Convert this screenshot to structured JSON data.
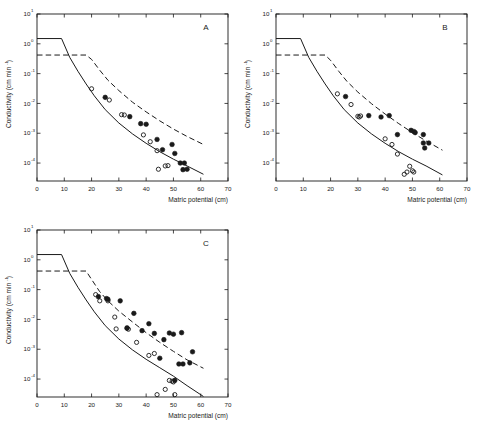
{
  "figure": {
    "panel_count": 3,
    "background": "#ffffff",
    "ink": "#1a1a1a"
  },
  "axes": {
    "x_title": "Matric potential (cm)",
    "y_title_main": "Conductivity (cm min",
    "y_title_exponent": "-1",
    "y_title_close": ")",
    "x_ticks": [
      "0",
      "10",
      "20",
      "30",
      "40",
      "50",
      "60",
      "70"
    ],
    "x_tick_values": [
      0,
      10,
      20,
      30,
      40,
      50,
      60,
      70
    ],
    "x_range": [
      0,
      70
    ],
    "y_tick_mantissa": "10",
    "y_tick_exponents": [
      "1",
      "0",
      "-1",
      "-2",
      "-3",
      "-4"
    ],
    "y_tick_values": [
      10,
      1,
      0.1,
      0.01,
      0.001,
      0.0001
    ],
    "y_range_log": [
      1,
      -4.6
    ],
    "grid": "off",
    "tick_direction": "inward"
  },
  "chart_data": {
    "type": "scatter",
    "title": "",
    "xlabel": "Matric potential (cm)",
    "ylabel": "Conductivity (cm min^-1)",
    "xlim": [
      0,
      70
    ],
    "ylim": [
      2.5e-05,
      10
    ],
    "yscale": "log",
    "grid": false,
    "legend": "none",
    "series_styles": {
      "filled_circle": "measured, closed symbol",
      "open_circle": "measured, open symbol",
      "solid_line": "model curve (solid)",
      "dashed_line": "model curve (dashed)"
    },
    "panels": [
      {
        "label": "A",
        "solid_curve": [
          [
            0,
            1.5
          ],
          [
            9,
            1.5
          ],
          [
            12,
            0.35
          ],
          [
            15,
            0.12
          ],
          [
            18,
            0.045
          ],
          [
            21,
            0.018
          ],
          [
            25,
            0.0062
          ],
          [
            30,
            0.0022
          ],
          [
            35,
            0.00095
          ],
          [
            40,
            0.00046
          ],
          [
            45,
            0.00024
          ],
          [
            50,
            0.000135
          ],
          [
            55,
            8e-05
          ],
          [
            61,
            4.2e-05
          ]
        ],
        "dashed_curve": [
          [
            0,
            0.42
          ],
          [
            18,
            0.42
          ],
          [
            20,
            0.3
          ],
          [
            23,
            0.13
          ],
          [
            26,
            0.06
          ],
          [
            30,
            0.027
          ],
          [
            35,
            0.011
          ],
          [
            40,
            0.0052
          ],
          [
            45,
            0.0026
          ],
          [
            50,
            0.00138
          ],
          [
            55,
            0.00078
          ],
          [
            61,
            0.00042
          ]
        ],
        "filled_points": [
          [
            25,
            0.016
          ],
          [
            34,
            0.0036
          ],
          [
            38,
            0.0021
          ],
          [
            40,
            0.002
          ],
          [
            44,
            0.00062
          ],
          [
            46,
            0.00028
          ],
          [
            49.5,
            0.00042
          ],
          [
            50.5,
            0.00021
          ],
          [
            52.5,
            0.0001
          ],
          [
            54,
            0.0001
          ],
          [
            53.5,
            6e-05
          ],
          [
            55,
            6.2e-05
          ]
        ],
        "open_points": [
          [
            20,
            0.031
          ],
          [
            26.5,
            0.013
          ],
          [
            31,
            0.0042
          ],
          [
            32,
            0.0041
          ],
          [
            39,
            0.00088
          ],
          [
            41.5,
            0.00052
          ],
          [
            44,
            0.00026
          ],
          [
            44.5,
            6.2e-05
          ],
          [
            47,
            8e-05
          ],
          [
            48,
            8.2e-05
          ]
        ]
      },
      {
        "label": "B",
        "solid_curve": [
          [
            0,
            1.5
          ],
          [
            9,
            1.5
          ],
          [
            12,
            0.35
          ],
          [
            15,
            0.12
          ],
          [
            18,
            0.045
          ],
          [
            21,
            0.018
          ],
          [
            25,
            0.0062
          ],
          [
            30,
            0.0022
          ],
          [
            35,
            0.00095
          ],
          [
            40,
            0.00046
          ],
          [
            45,
            0.00024
          ],
          [
            50,
            0.000135
          ],
          [
            55,
            8e-05
          ],
          [
            61,
            4e-05
          ]
        ],
        "dashed_curve": [
          [
            0,
            0.42
          ],
          [
            18,
            0.42
          ],
          [
            20,
            0.28
          ],
          [
            23,
            0.12
          ],
          [
            26,
            0.055
          ],
          [
            30,
            0.024
          ],
          [
            35,
            0.0098
          ],
          [
            40,
            0.0044
          ],
          [
            45,
            0.0021
          ],
          [
            50,
            0.00105
          ],
          [
            55,
            0.00055
          ],
          [
            61,
            0.00027
          ]
        ],
        "filled_points": [
          [
            25.5,
            0.017
          ],
          [
            34,
            0.0039
          ],
          [
            38.5,
            0.0035
          ],
          [
            41.5,
            0.0039
          ],
          [
            44.5,
            0.0009
          ],
          [
            49.5,
            0.00125
          ],
          [
            50.5,
            0.00115
          ],
          [
            51,
            0.00105
          ],
          [
            54,
            0.0009
          ],
          [
            54,
            0.00047
          ],
          [
            56,
            0.00047
          ],
          [
            54.5,
            0.00032
          ]
        ],
        "open_points": [
          [
            22.5,
            0.021
          ],
          [
            27.5,
            0.0092
          ],
          [
            30,
            0.0037
          ],
          [
            30.5,
            0.0035
          ],
          [
            31,
            0.0038
          ],
          [
            40,
            0.00065
          ],
          [
            42.5,
            0.00042
          ],
          [
            44.5,
            0.0002
          ],
          [
            47,
            4.2e-05
          ],
          [
            48,
            5e-05
          ],
          [
            49,
            7.8e-05
          ],
          [
            50,
            5.5e-05
          ],
          [
            50.5,
            5e-05
          ]
        ]
      },
      {
        "label": "C",
        "solid_curve": [
          [
            0,
            1.5
          ],
          [
            9,
            1.5
          ],
          [
            12,
            0.35
          ],
          [
            15,
            0.12
          ],
          [
            18,
            0.045
          ],
          [
            21,
            0.018
          ],
          [
            25,
            0.0062
          ],
          [
            30,
            0.0022
          ],
          [
            35,
            0.00095
          ],
          [
            40,
            0.00046
          ],
          [
            45,
            0.00024
          ],
          [
            50,
            0.000125
          ],
          [
            55,
            6e-05
          ],
          [
            61,
            2.6e-05
          ]
        ],
        "dashed_curve": [
          [
            0,
            0.42
          ],
          [
            18,
            0.42
          ],
          [
            20,
            0.22
          ],
          [
            23,
            0.085
          ],
          [
            26,
            0.042
          ],
          [
            30,
            0.019
          ],
          [
            35,
            0.0082
          ],
          [
            40,
            0.0036
          ],
          [
            45,
            0.0017
          ],
          [
            50,
            0.00085
          ],
          [
            55,
            0.00044
          ],
          [
            61,
            0.00023
          ]
        ],
        "filled_points": [
          [
            22.5,
            0.058
          ],
          [
            25.5,
            0.05
          ],
          [
            26,
            0.047
          ],
          [
            30.5,
            0.042
          ],
          [
            33,
            0.0052
          ],
          [
            35.5,
            0.016
          ],
          [
            38.5,
            0.0042
          ],
          [
            41,
            0.0072
          ],
          [
            43,
            0.0034
          ],
          [
            45,
            0.0005
          ],
          [
            46.5,
            0.0021
          ],
          [
            48.5,
            0.0035
          ],
          [
            50,
            0.0032
          ],
          [
            50.5,
            9e-05
          ],
          [
            52,
            0.00032
          ],
          [
            53.5,
            0.00032
          ],
          [
            56,
            0.00035
          ],
          [
            57,
            0.00082
          ],
          [
            53,
            0.0036
          ]
        ],
        "open_points": [
          [
            21.5,
            0.068
          ],
          [
            23,
            0.042
          ],
          [
            26,
            0.042
          ],
          [
            28.5,
            0.012
          ],
          [
            29,
            0.0048
          ],
          [
            33,
            0.005
          ],
          [
            33.5,
            0.0047
          ],
          [
            36.5,
            0.0017
          ],
          [
            41,
            0.00062
          ],
          [
            43,
            0.00072
          ],
          [
            44,
            3e-05
          ],
          [
            47,
            4.5e-05
          ],
          [
            48.5,
            9e-05
          ],
          [
            50,
            8e-05
          ],
          [
            50.5,
            3e-05
          ],
          [
            49.5,
            8.5e-05
          ]
        ]
      }
    ]
  }
}
